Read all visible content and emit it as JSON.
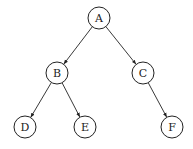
{
  "diagram": {
    "type": "binary-tree",
    "node_radius": 11,
    "stroke_color": "#222222",
    "nodes": [
      {
        "id": "A",
        "label": "A",
        "x": 99,
        "y": 18
      },
      {
        "id": "B",
        "label": "B",
        "x": 57,
        "y": 73
      },
      {
        "id": "C",
        "label": "C",
        "x": 143,
        "y": 73
      },
      {
        "id": "D",
        "label": "D",
        "x": 25,
        "y": 127
      },
      {
        "id": "E",
        "label": "E",
        "x": 85,
        "y": 127
      },
      {
        "id": "F",
        "label": "F",
        "x": 172,
        "y": 127
      }
    ],
    "edges": [
      {
        "from": "A",
        "to": "B"
      },
      {
        "from": "A",
        "to": "C"
      },
      {
        "from": "B",
        "to": "D"
      },
      {
        "from": "B",
        "to": "E"
      },
      {
        "from": "C",
        "to": "F"
      }
    ]
  }
}
